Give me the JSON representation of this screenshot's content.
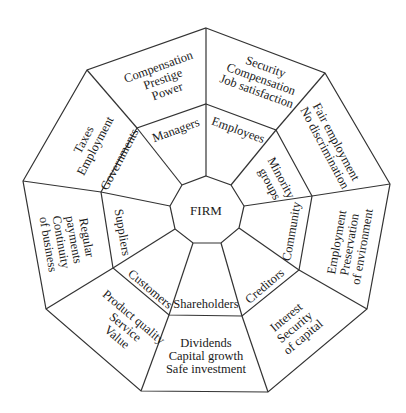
{
  "diagram": {
    "center": {
      "label": "FIRM"
    },
    "stakeholders": [
      {
        "name": "Managers",
        "interests": [
          "Compensation",
          "Prestige",
          "Power"
        ]
      },
      {
        "name": "Employees",
        "interests": [
          "Security",
          "Compensation",
          "Job satisfaction"
        ]
      },
      {
        "name": "Minority groups",
        "name_lines": [
          "Minority",
          "groups"
        ],
        "interests": [
          "Fair employment",
          "No discrimination"
        ]
      },
      {
        "name": "Community",
        "interests": [
          "Employment",
          "Preservation",
          "of environment"
        ]
      },
      {
        "name": "Creditors",
        "interests": [
          "Interest",
          "Security",
          "of capital"
        ]
      },
      {
        "name": "Shareholders",
        "interests": [
          "Dividends",
          "Capital growth",
          "Safe investment"
        ]
      },
      {
        "name": "Customers",
        "interests": [
          "Product quality",
          "Service",
          "Value"
        ]
      },
      {
        "name": "Suppliers",
        "interests": [
          "Regular",
          "payments",
          "Continuity",
          "of business"
        ]
      },
      {
        "name": "Governments",
        "interests": [
          "Taxes",
          "Employment"
        ]
      }
    ],
    "colors": {
      "line": "#333333",
      "text": "#1a1a1a",
      "background": "#ffffff"
    }
  }
}
